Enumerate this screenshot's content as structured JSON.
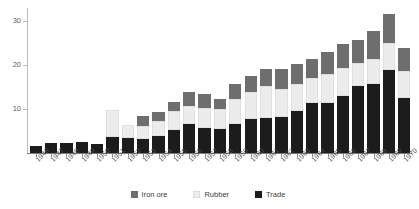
{
  "chart_data": {
    "type": "bar",
    "stacked": true,
    "title": "",
    "subtitle": "",
    "xlabel": "",
    "ylabel": "",
    "grid": false,
    "legend_position": "bottom",
    "ylim": [
      0,
      33
    ],
    "yticks": [
      10,
      20,
      30
    ],
    "ytick_labels": [
      "10",
      "20",
      "30"
    ],
    "categories": [
      "1946",
      "1947",
      "1948",
      "1949",
      "1950",
      "1951",
      "1952",
      "1953",
      "1954",
      "1955",
      "1956",
      "1957",
      "1958",
      "1959",
      "1960",
      "1961",
      "1962",
      "1963",
      "1964",
      "1965",
      "1966",
      "1967",
      "1968",
      "1969",
      "1970"
    ],
    "series": [
      {
        "name": "Trade",
        "color": "#1c1c1c",
        "values": [
          1.7,
          2.2,
          2.2,
          2.4,
          2.0,
          3.6,
          3.5,
          3.2,
          3.9,
          5.2,
          6.6,
          5.6,
          5.5,
          6.7,
          7.7,
          8.0,
          8.2,
          9.6,
          11.3,
          11.3,
          12.9,
          15.2,
          15.8,
          18.8,
          12.6
        ]
      },
      {
        "name": "Rubber",
        "color": "#ececec",
        "values": [
          0.0,
          0.0,
          0.0,
          0.0,
          0.0,
          6.3,
          2.8,
          3.0,
          3.3,
          4.3,
          4.1,
          4.6,
          4.6,
          5.6,
          6.2,
          7.2,
          6.3,
          6.1,
          5.7,
          6.7,
          6.4,
          5.3,
          5.6,
          6.2,
          6.1
        ]
      },
      {
        "name": "Iron ore",
        "color": "#6e6e6e",
        "values": [
          0.0,
          0.0,
          0.0,
          0.0,
          0.0,
          0.0,
          0.0,
          2.3,
          2.2,
          2.1,
          3.3,
          3.3,
          2.1,
          3.5,
          3.6,
          3.9,
          4.6,
          4.5,
          4.5,
          5.0,
          5.6,
          5.3,
          6.4,
          6.7,
          5.1
        ]
      }
    ],
    "legend": [
      {
        "label": "Iron ore",
        "color": "#6e6e6e"
      },
      {
        "label": "Rubber",
        "color": "#ececec"
      },
      {
        "label": "Trade",
        "color": "#1c1c1c"
      }
    ]
  }
}
